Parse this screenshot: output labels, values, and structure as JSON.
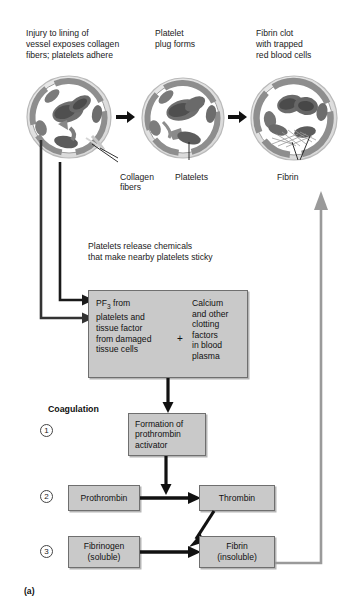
{
  "figure": {
    "caption": "(a)",
    "stages": [
      {
        "id": "stage-1",
        "caption": "Injury to lining of\nvessel exposes collagen\nfibers; platelets adhere",
        "label": "Collagen\nfibers"
      },
      {
        "id": "stage-2",
        "caption": "Platelet\nplug forms",
        "label": "Platelets"
      },
      {
        "id": "stage-3",
        "caption": "Fibrin clot\nwith trapped\nred blood cells",
        "label": "Fibrin"
      }
    ],
    "release_text": "Platelets release chemicals\nthat make nearby platelets sticky",
    "reactant_box": {
      "left_text": "PF3 from\nplatelets and\ntissue factor\nfrom damaged\ntissue cells",
      "left_text_prefix": "PF",
      "left_text_subscript": "3",
      "left_text_rest": " from\nplatelets and\ntissue factor\nfrom damaged\ntissue cells",
      "operator": "+",
      "right_text": "Calcium\nand other\nclotting\nfactors\nin blood\nplasma"
    },
    "coagulation_heading": "Coagulation",
    "steps": [
      {
        "number": "1",
        "box": "Formation of\nprothrombin\nactivator"
      },
      {
        "number": "2",
        "box_left": "Prothrombin",
        "box_right": "Thrombin"
      },
      {
        "number": "3",
        "box_left": "Fibrinogen\n(soluble)",
        "box_right": "Fibrin\n(insoluble)"
      }
    ]
  },
  "colors": {
    "box_fill": "#c9c9c9",
    "box_border": "#6f6f6f",
    "arrow_black": "#1a1a1a",
    "arrow_gray": "#9a9a9a",
    "vessel_wall_outer": "#cfcfcf",
    "vessel_wall_inner": "#8c8c8c",
    "rbc_dark": "#5e5e5e",
    "rbc_mid": "#7d7d7d",
    "background": "#ffffff"
  }
}
